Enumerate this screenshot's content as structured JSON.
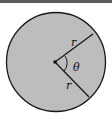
{
  "figure": {
    "type": "sector-diagram",
    "labels": {
      "radius_upper": "r",
      "radius_lower": "r",
      "angle": "θ"
    },
    "colors": {
      "fill": "#bdbdbd",
      "stroke": "#1a1a1a",
      "topbar": "#5a5a5a"
    }
  }
}
